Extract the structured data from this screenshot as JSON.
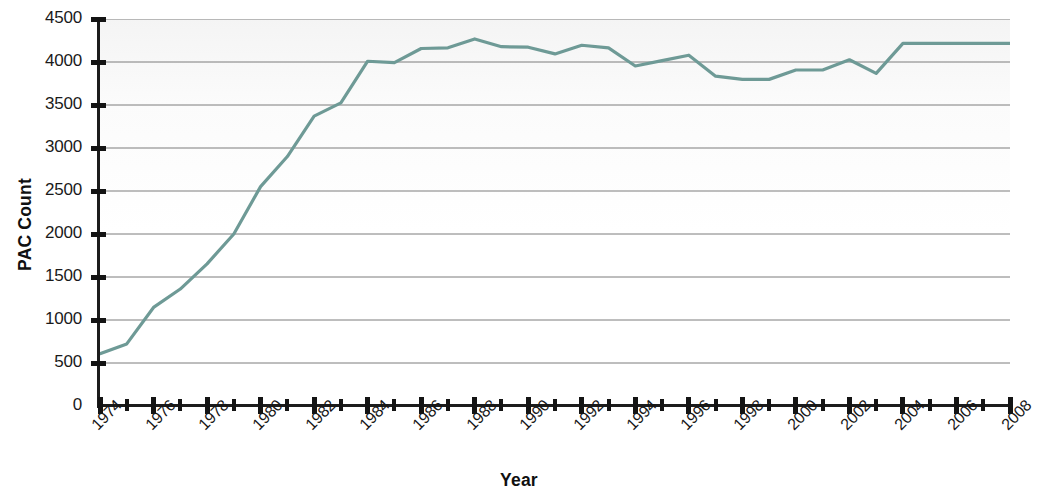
{
  "chart_data": {
    "type": "line",
    "title": "",
    "xlabel": "Year",
    "ylabel": "PAC Count",
    "xlim": [
      1974,
      2008
    ],
    "ylim": [
      0,
      4500
    ],
    "ytick_step": 500,
    "xtick_step": 2,
    "grid": true,
    "legend": "none",
    "line_color": "#6e9a96",
    "x": [
      1974,
      1975,
      1976,
      1977,
      1978,
      1979,
      1980,
      1981,
      1982,
      1983,
      1984,
      1985,
      1986,
      1987,
      1988,
      1989,
      1990,
      1991,
      1992,
      1993,
      1994,
      1995,
      1996,
      1997,
      1998,
      1999,
      2000,
      2001,
      2002,
      2003,
      2004,
      2005,
      2006,
      2007,
      2008
    ],
    "values": [
      608,
      722,
      1146,
      1360,
      1653,
      2000,
      2551,
      2901,
      3371,
      3525,
      4009,
      3992,
      4157,
      4165,
      4268,
      4178,
      4172,
      4094,
      4195,
      4164,
      3954,
      4016,
      4079,
      3835,
      3798,
      3798,
      3907,
      3907,
      4026,
      3868,
      4216,
      4216,
      4216,
      4216,
      4216
    ],
    "ytick_labels": [
      "0",
      "500",
      "1000",
      "1500",
      "2000",
      "2500",
      "3000",
      "3500",
      "4000",
      "4500"
    ],
    "ytick_values": [
      0,
      500,
      1000,
      1500,
      2000,
      2500,
      3000,
      3500,
      4000,
      4500
    ],
    "xtick_labels": [
      "1974",
      "1976",
      "1978",
      "1980",
      "1982",
      "1984",
      "1986",
      "1988",
      "1990",
      "1992",
      "1994",
      "1996",
      "1998",
      "2000",
      "2002",
      "2004",
      "2006",
      "2008"
    ],
    "xtick_values": [
      1974,
      1976,
      1978,
      1980,
      1982,
      1984,
      1986,
      1988,
      1990,
      1992,
      1994,
      1996,
      1998,
      2000,
      2002,
      2004,
      2006,
      2008
    ],
    "xtick_minor_values": [
      1975,
      1977,
      1979,
      1981,
      1983,
      1985,
      1987,
      1989,
      1991,
      1993,
      1995,
      1997,
      1999,
      2001,
      2003,
      2005,
      2007
    ]
  }
}
